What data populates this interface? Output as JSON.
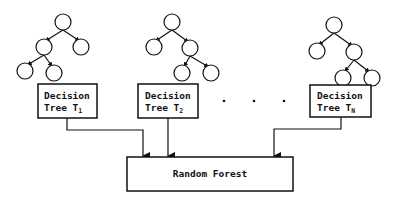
{
  "diagram": {
    "title": "Random Forest",
    "trees": [
      {
        "label_line1": "Decision",
        "label_line2": "Tree T",
        "subscript": "1"
      },
      {
        "label_line1": "Decision",
        "label_line2": "Tree T",
        "subscript": "2"
      },
      {
        "label_line1": "Decision",
        "label_line2": "Tree T",
        "subscript": "N"
      }
    ],
    "ellipsis": "· · ·",
    "output_box_label": "Random Forest"
  }
}
